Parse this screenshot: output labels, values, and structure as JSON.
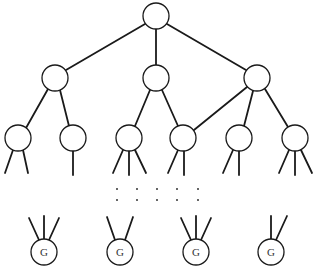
{
  "diagram": {
    "type": "tree",
    "goal_label": "G",
    "colors": {
      "stroke": "#1a1a1a",
      "fill": "#ffffff",
      "background": "#ffffff"
    },
    "nodes": {
      "root": {
        "x": 156,
        "y": 16
      },
      "level1": [
        {
          "x": 55,
          "y": 78
        },
        {
          "x": 156,
          "y": 78
        },
        {
          "x": 257,
          "y": 78
        }
      ],
      "level2": [
        {
          "x": 18,
          "y": 138
        },
        {
          "x": 73,
          "y": 138
        },
        {
          "x": 129,
          "y": 138
        },
        {
          "x": 183,
          "y": 138
        },
        {
          "x": 239,
          "y": 138
        },
        {
          "x": 295,
          "y": 138
        }
      ],
      "goals": [
        {
          "x": 44,
          "y": 252,
          "label": "G"
        },
        {
          "x": 120,
          "y": 252,
          "label": "G"
        },
        {
          "x": 196,
          "y": 252,
          "label": "G"
        },
        {
          "x": 271,
          "y": 252,
          "label": "G"
        }
      ]
    },
    "ellipsis_rows": 2,
    "ellipsis_cols": 5
  }
}
